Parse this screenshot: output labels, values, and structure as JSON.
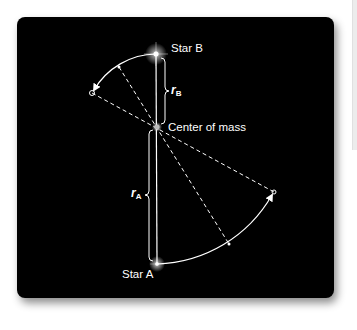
{
  "diagram": {
    "labels": {
      "star_b": "Star B",
      "star_a": "Star A",
      "center_of_mass": "Center of mass",
      "r_b_symbol": "r",
      "r_b_subscript": "B",
      "r_a_symbol": "r",
      "r_a_subscript": "A"
    },
    "colors": {
      "background": "#000000",
      "lines": "#ffffff",
      "page": "#ffffff"
    },
    "points": {
      "star_b": [
        156,
        54
      ],
      "center_of_mass": [
        157,
        127
      ],
      "star_a": [
        157,
        264
      ],
      "star_b_future": [
        92,
        93
      ],
      "star_a_future": [
        274,
        192
      ],
      "star_b_tick": [
        119,
        67
      ],
      "star_a_tick": [
        229,
        244
      ]
    }
  }
}
